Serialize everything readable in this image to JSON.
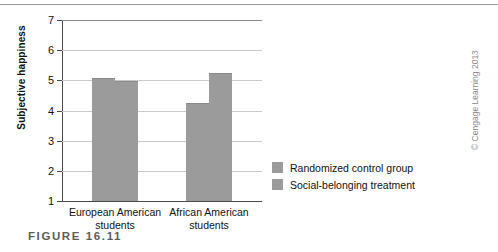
{
  "figure": {
    "caption": "FIGURE 16.11",
    "credit": "© Cengage Learning 2013"
  },
  "chart_data": {
    "type": "bar",
    "title": "",
    "xlabel": "",
    "ylabel": "Subjective happiness",
    "ylim": [
      1,
      7
    ],
    "yticks": [
      1,
      2,
      3,
      4,
      5,
      6,
      7
    ],
    "ytick_labels": [
      "1",
      "2",
      "3",
      "4",
      "5",
      "6",
      "7"
    ],
    "grid": true,
    "legend_position": "right",
    "categories": [
      "European American students",
      "African American students"
    ],
    "category_lines": [
      [
        "European American",
        "students"
      ],
      [
        "African American",
        "students"
      ]
    ],
    "series": [
      {
        "name": "Randomized control group",
        "color": "#9b9b9b",
        "values": [
          5.05,
          4.2
        ]
      },
      {
        "name": "Social-belonging treatment",
        "color": "#9b9b9b",
        "values": [
          4.95,
          5.2
        ]
      }
    ]
  }
}
